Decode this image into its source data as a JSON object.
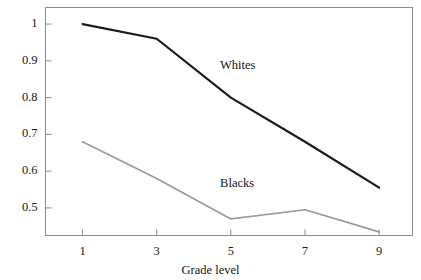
{
  "chart_data": {
    "type": "line",
    "title": "",
    "xlabel": "Grade level",
    "ylabel": "",
    "x": [
      1,
      3,
      5,
      7,
      9
    ],
    "xticklabels": [
      "1",
      "3",
      "5",
      "7",
      "9"
    ],
    "yticks": [
      0.5,
      0.6,
      0.7,
      0.8,
      0.9,
      1
    ],
    "yticklabels": [
      "0.5",
      "0.6",
      "0.7",
      "0.8",
      "0.9",
      "1"
    ],
    "xlim": [
      0.0,
      9.9
    ],
    "ylim": [
      0.425,
      1.045
    ],
    "grid": false,
    "legend_position": "inline-annotation",
    "series": [
      {
        "name": "Whites",
        "values": [
          1.0,
          0.96,
          0.8,
          0.68,
          0.555
        ],
        "color": "#1a1a1a",
        "line_width": 2.2,
        "label_x": 5.3,
        "label_y": 0.885
      },
      {
        "name": "Blacks",
        "values": [
          0.68,
          0.58,
          0.47,
          0.495,
          0.435
        ],
        "color": "#9a9a9a",
        "line_width": 1.7,
        "label_x": 5.25,
        "label_y": 0.565
      }
    ]
  },
  "axes": {
    "frame_color": "#8c8c8c",
    "tick_color": "#8c8c8c",
    "background": "#ffffff"
  },
  "yticks_render": [
    {
      "label": "1",
      "top": 35,
      "right": 39
    },
    {
      "label": "0.9",
      "top": 67,
      "right": 39
    },
    {
      "label": "0.8",
      "top": 100,
      "right": 39
    },
    {
      "label": "0.7",
      "top": 132,
      "right": 39
    },
    {
      "label": "0.6",
      "top": 164,
      "right": 39
    },
    {
      "label": "0.5",
      "top": 197,
      "right": 39
    }
  ],
  "xticks_render": [
    {
      "label": "1",
      "left": 50,
      "top": 245
    },
    {
      "label": "3",
      "left": 136,
      "top": 245
    },
    {
      "label": "5",
      "left": 222,
      "top": 245
    },
    {
      "label": "7",
      "left": 308,
      "top": 245
    },
    {
      "label": "9",
      "left": 394,
      "top": 245
    }
  ],
  "annotations": {
    "whites_label": "Whites",
    "blacks_label": "Blacks",
    "axis_title": "Grade level"
  }
}
